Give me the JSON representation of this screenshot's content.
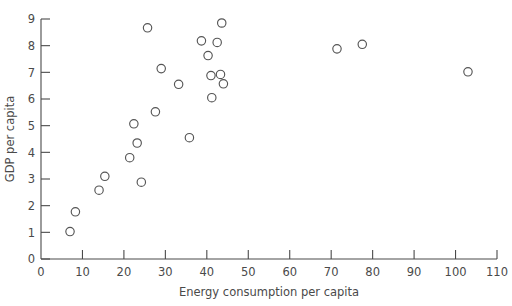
{
  "chart_data": {
    "type": "scatter",
    "title": "",
    "xlabel": "Energy consumption per capita",
    "ylabel": "GDP per capita",
    "xlim": [
      0,
      110
    ],
    "ylim": [
      0,
      9
    ],
    "xticks": [
      0,
      10,
      20,
      30,
      40,
      50,
      60,
      70,
      80,
      90,
      100,
      110
    ],
    "yticks": [
      0,
      1,
      2,
      3,
      4,
      5,
      6,
      7,
      8,
      9
    ],
    "xtick_labels": [
      "0",
      "10",
      "20",
      "30",
      "40",
      "50",
      "60",
      "70",
      "80",
      "90",
      "100",
      "110"
    ],
    "ytick_labels": [
      "0",
      "1",
      "2",
      "3",
      "4",
      "5",
      "6",
      "7",
      "8",
      "9"
    ],
    "grid": false,
    "legend": null,
    "marker": "open-circle",
    "marker_color": "#555555",
    "marker_size": 4.2,
    "points": [
      {
        "x": 7.0,
        "y": 1.03
      },
      {
        "x": 8.3,
        "y": 1.77
      },
      {
        "x": 14.0,
        "y": 2.58
      },
      {
        "x": 15.4,
        "y": 3.1
      },
      {
        "x": 21.4,
        "y": 3.8
      },
      {
        "x": 22.4,
        "y": 5.07
      },
      {
        "x": 23.2,
        "y": 4.35
      },
      {
        "x": 24.2,
        "y": 2.88
      },
      {
        "x": 25.7,
        "y": 8.67
      },
      {
        "x": 27.6,
        "y": 5.52
      },
      {
        "x": 29.0,
        "y": 7.14
      },
      {
        "x": 33.2,
        "y": 6.55
      },
      {
        "x": 35.8,
        "y": 4.55
      },
      {
        "x": 38.7,
        "y": 8.18
      },
      {
        "x": 40.3,
        "y": 7.63
      },
      {
        "x": 41.0,
        "y": 6.88
      },
      {
        "x": 41.2,
        "y": 6.05
      },
      {
        "x": 42.5,
        "y": 8.12
      },
      {
        "x": 43.3,
        "y": 6.92
      },
      {
        "x": 43.6,
        "y": 8.85
      },
      {
        "x": 44.0,
        "y": 6.57
      },
      {
        "x": 71.4,
        "y": 7.88
      },
      {
        "x": 77.5,
        "y": 8.05
      },
      {
        "x": 103.0,
        "y": 7.02
      }
    ]
  },
  "axes": {
    "x_axis_name": "x-axis",
    "y_axis_name": "y-axis"
  }
}
